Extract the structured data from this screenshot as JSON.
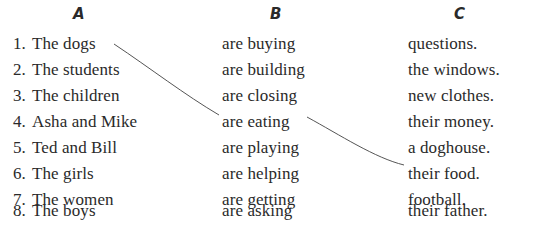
{
  "exercise": {
    "columns": [
      {
        "label": "A",
        "items": [
          {
            "num": "1.",
            "text": "The dogs"
          },
          {
            "num": "2.",
            "text": "The students"
          },
          {
            "num": "3.",
            "text": "The children"
          },
          {
            "num": "4.",
            "text": "Asha and Mike"
          },
          {
            "num": "5.",
            "text": "Ted and Bill"
          },
          {
            "num": "6.",
            "text": "The girls"
          },
          {
            "num": "7.",
            "text": "The women"
          },
          {
            "num": "8.",
            "text": "The boys"
          }
        ]
      },
      {
        "label": "B",
        "items": [
          {
            "text": "are buying"
          },
          {
            "text": "are building"
          },
          {
            "text": "are closing"
          },
          {
            "text": "are eating"
          },
          {
            "text": "are playing"
          },
          {
            "text": "are helping"
          },
          {
            "text": "are getting"
          },
          {
            "text": "are asking"
          }
        ]
      },
      {
        "label": "C",
        "items": [
          {
            "text": "questions."
          },
          {
            "text": "the windows."
          },
          {
            "text": "new clothes."
          },
          {
            "text": "their money."
          },
          {
            "text": "a doghouse."
          },
          {
            "text": "their food."
          },
          {
            "text": "football."
          },
          {
            "text": "their father."
          }
        ]
      }
    ],
    "connections": [
      {
        "from": "A1",
        "to": "B4",
        "label": "The dogs → are eating"
      },
      {
        "from": "B4",
        "to": "C6",
        "label": "are eating → their food."
      }
    ],
    "line_color": "#555555"
  }
}
